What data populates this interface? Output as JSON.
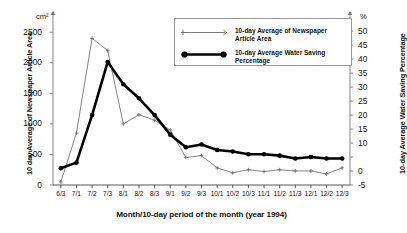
{
  "chart_data": {
    "type": "line",
    "title": "",
    "xlabel": "Month/10-day period of the month (year 1994)",
    "categories": [
      "6/3",
      "7/1",
      "7/2",
      "7/3",
      "8/1",
      "8/2",
      "8/3",
      "9/1",
      "9/2",
      "9/3",
      "10/1",
      "10/2",
      "10/3",
      "11/1",
      "11/2",
      "11/3",
      "12/1",
      "12/2",
      "12/3"
    ],
    "axes": {
      "left": {
        "label": "10 day Average of Newspaper Article Area",
        "unit": "cm²",
        "ticks": [
          2500,
          2000,
          1500,
          1000,
          500,
          0
        ],
        "ylim": [
          0,
          2700
        ],
        "tick_labels": [
          "2500",
          "2000",
          "1500",
          "1000",
          "500",
          "0"
        ]
      },
      "right": {
        "label": "10-day Average  Water Saving Percentage",
        "unit": "%",
        "ticks": [
          50,
          45,
          40,
          35,
          30,
          25,
          20,
          15,
          10,
          5,
          0,
          -5
        ],
        "ylim": [
          -5,
          54
        ],
        "tick_labels": [
          "50",
          "45",
          "40",
          "35",
          "30",
          "25",
          "20",
          "15",
          "10",
          "",
          "0",
          "-5"
        ]
      }
    },
    "grid": false,
    "legend_position": "upper-center",
    "series": [
      {
        "name": "10-day Average of Newspaper Article Area",
        "axis": "left",
        "style": "thin",
        "color": "#6b6b6b",
        "marker": "cross",
        "values": [
          50,
          850,
          2400,
          2200,
          1000,
          1150,
          1060,
          900,
          450,
          480,
          280,
          200,
          250,
          220,
          250,
          230,
          230,
          180,
          280
        ]
      },
      {
        "name": "10-day Average Water Saving Percentage",
        "axis": "right",
        "style": "bold",
        "color": "#000000",
        "marker": "dot",
        "values": [
          1,
          3,
          20,
          39,
          31,
          26,
          20,
          13,
          8.5,
          9.5,
          7.5,
          7,
          6,
          6,
          5.5,
          4.5,
          5,
          4.5,
          4.5
        ]
      }
    ]
  },
  "legend": {
    "entries": [
      {
        "label": "10-day Average of Newspaper\n Article Area"
      },
      {
        "label": "10-day Average Water Saving\n Percentage"
      }
    ]
  }
}
